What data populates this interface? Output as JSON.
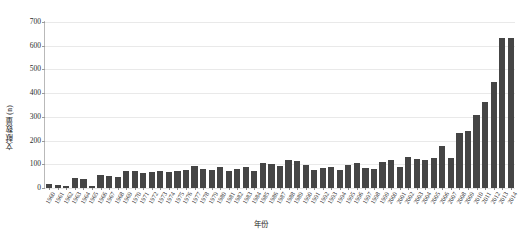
{
  "chart_data": {
    "type": "bar",
    "title": "",
    "xlabel": "年份",
    "ylabel": "文献数量 (n)",
    "ylim": [
      0,
      700
    ],
    "ytick_values": [
      0,
      100,
      200,
      300,
      400,
      500,
      600,
      700
    ],
    "ytick_labels": [
      "0",
      "100",
      "200",
      "300",
      "400",
      "500",
      "600",
      "700"
    ],
    "grid": "horizontal",
    "legend": "none",
    "bar_color": "#454545",
    "grid_color": "#e9e9e9",
    "axis_color": "#7d7d7d",
    "categories": [
      "1960",
      "1961",
      "1962",
      "1963",
      "1964",
      "1965",
      "1966",
      "1967",
      "1968",
      "1969",
      "1970",
      "1971",
      "1972",
      "1973",
      "1974",
      "1975",
      "1976",
      "1977",
      "1978",
      "1979",
      "1980",
      "1981",
      "1982",
      "1983",
      "1984",
      "1985",
      "1986",
      "1987",
      "1988",
      "1989",
      "1990",
      "1991",
      "1992",
      "1993",
      "1994",
      "1995",
      "1996",
      "1997",
      "1998",
      "1999",
      "2000",
      "2001",
      "2002",
      "2003",
      "2004",
      "2005",
      "2006",
      "2007",
      "2008",
      "2009",
      "2010",
      "2011",
      "2012",
      "2013",
      "2014"
    ],
    "values": [
      18,
      12,
      8,
      42,
      40,
      10,
      55,
      52,
      48,
      70,
      72,
      62,
      68,
      70,
      66,
      70,
      78,
      92,
      82,
      74,
      88,
      72,
      82,
      88,
      72,
      104,
      100,
      92,
      118,
      112,
      96,
      78,
      86,
      90,
      76,
      96,
      104,
      86,
      80,
      110,
      120,
      90,
      132,
      124,
      120,
      128,
      176,
      128,
      234,
      240,
      308,
      364,
      446,
      632,
      632
    ]
  }
}
